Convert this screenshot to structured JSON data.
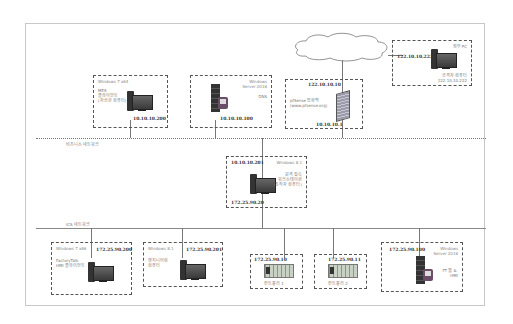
{
  "diagram": {
    "networks": {
      "corporate": {
        "label": "비즈니스 네트워크"
      },
      "ics": {
        "label": "ICS 네트워크"
      }
    },
    "internet": {
      "label": ""
    },
    "nodes": {
      "mes": {
        "os": "Windows 7 x64",
        "role": "MES\n클라이언트\n(자산관 컴퓨터)",
        "ip": "10.10.10.200",
        "icon": "desktop-pc-icon"
      },
      "dns": {
        "os": "Windows\nServer 2016",
        "role": "DNS",
        "ip": "10.10.10.100",
        "icon": "server-icon"
      },
      "pfsense": {
        "os": "",
        "role": "pfSense 방화벽\n(www.pfsense.org)",
        "ip_wan": "122.10.10.10",
        "ip_lan": "10.10.10.1",
        "icon": "firewall-icon"
      },
      "attacker": {
        "os": "",
        "role_top": "외부 PC",
        "role": "공격자 컴퓨터\n122.10.10.222",
        "ip": "122.10.10.222",
        "icon": "desktop-pc-icon"
      },
      "jump": {
        "os": "Windows 8.1",
        "role": "원격 접속\n워크스테이션\n(조작자 컴퓨터)",
        "ip_top": "10.10.10.201",
        "ip_bottom": "172.25.90.20",
        "icon": "desktop-pc-icon"
      },
      "factorytalk": {
        "os": "Windows 7 x86",
        "role": "FactoryTalk\nHMI 클라이언트",
        "ip": "172.25.90.200",
        "icon": "desktop-pc-icon"
      },
      "eng": {
        "os": "Windows 8.1",
        "role": "엔지니어링\n컴퓨터",
        "ip": "172.25.90.201",
        "icon": "desktop-pc-icon"
      },
      "plc1": {
        "role": "컨트롤러 1",
        "ip": "172.25.90.10",
        "icon": "plc-icon"
      },
      "plc2": {
        "role": "컨트롤러 2",
        "ip": "172.25.90.11",
        "icon": "plc-icon"
      },
      "ftserver": {
        "os": "Windows\nServer 2016",
        "role": "FT 웹 & \nHMI",
        "ip": "172.25.90.100",
        "icon": "server-icon"
      }
    }
  }
}
